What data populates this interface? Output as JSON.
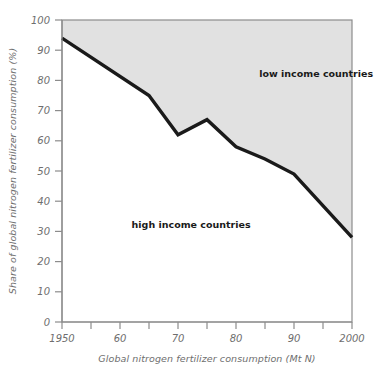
{
  "chart_data": {
    "type": "area",
    "title": "",
    "subtitle": "",
    "xlabel": "Global nitrogen fertilizer consumption (Mt N)",
    "ylabel": "Share of global nitrogen fertilizer consumption (%)",
    "xlim": [
      1950,
      2000
    ],
    "ylim": [
      0,
      100
    ],
    "grid": false,
    "legend_position": "inline-annotation",
    "x_ticks": [
      1950,
      1955,
      1960,
      1965,
      1970,
      1975,
      1980,
      1985,
      1990,
      1995,
      2000
    ],
    "x_tick_labels": [
      "1950",
      "",
      "60",
      "",
      "70",
      "",
      "80",
      "",
      "90",
      "",
      "2000"
    ],
    "y_ticks": [
      0,
      10,
      20,
      30,
      40,
      50,
      60,
      70,
      80,
      90,
      100
    ],
    "y_tick_labels": [
      "0",
      "10",
      "20",
      "30",
      "40",
      "50",
      "60",
      "70",
      "80",
      "90",
      "100"
    ],
    "x": [
      1950,
      1965,
      1970,
      1975,
      1980,
      1985,
      1990,
      2000
    ],
    "series": [
      {
        "name": "low income countries",
        "values": [
          6,
          25,
          38,
          33,
          42,
          46,
          51,
          72
        ],
        "fill_color": "#e1e1e1",
        "annotation": "low income countries",
        "annotation_x": 1984,
        "annotation_y": 81
      },
      {
        "name": "high income countries",
        "values": [
          94,
          75,
          62,
          67,
          58,
          54,
          49,
          28
        ],
        "fill_color": "#ffffff",
        "annotation": "high income countries",
        "annotation_x": 1962,
        "annotation_y": 31
      }
    ],
    "boundary_line": {
      "name": "high-income share boundary",
      "color": "#1a1a1a",
      "width": 3,
      "points": [
        {
          "x": 1950,
          "y": 94
        },
        {
          "x": 1965,
          "y": 75
        },
        {
          "x": 1970,
          "y": 62
        },
        {
          "x": 1975,
          "y": 67
        },
        {
          "x": 1980,
          "y": 58
        },
        {
          "x": 1985,
          "y": 54
        },
        {
          "x": 1990,
          "y": 49
        },
        {
          "x": 2000,
          "y": 28
        }
      ]
    },
    "axis_color": "#8c8c8c",
    "plot_border_color": "#8c8c8c",
    "background_color": "#ffffff"
  },
  "labels": {
    "y_axis_title": "Share of global nitrogen fertilizer consumption (%)",
    "x_axis_title": "Global nitrogen fertilizer consumption (Mt N)",
    "low_income": "low income countries",
    "high_income": "high income countries"
  },
  "x_tick_text": {
    "t0": "1950",
    "t1": "60",
    "t2": "70",
    "t3": "80",
    "t4": "90",
    "t5": "2000"
  },
  "y_tick_text": {
    "t0": "0",
    "t1": "10",
    "t2": "20",
    "t3": "30",
    "t4": "40",
    "t5": "50",
    "t6": "60",
    "t7": "70",
    "t8": "80",
    "t9": "90",
    "t10": "100"
  }
}
